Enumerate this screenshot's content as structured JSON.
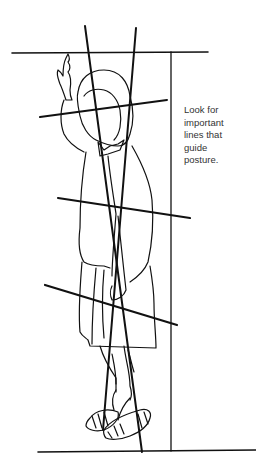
{
  "caption": {
    "text": "Look for\nimportant\nlines that\nguide\nposture."
  },
  "figure": {
    "guide_lines": [
      {
        "name": "top-horizontal",
        "x1": 12,
        "y1": 53,
        "x2": 208,
        "y2": 52
      },
      {
        "name": "bottom-horizontal",
        "x1": 38,
        "y1": 452,
        "x2": 256,
        "y2": 450
      },
      {
        "name": "right-vertical",
        "x1": 171,
        "y1": 52,
        "x2": 171,
        "y2": 451
      },
      {
        "name": "axis-line-1",
        "x1": 85,
        "y1": 26,
        "x2": 142,
        "y2": 452
      },
      {
        "name": "axis-line-2",
        "x1": 136,
        "y1": 28,
        "x2": 103,
        "y2": 430
      },
      {
        "name": "eye-line",
        "x1": 40,
        "y1": 117,
        "x2": 167,
        "y2": 100
      },
      {
        "name": "waist-line",
        "x1": 58,
        "y1": 198,
        "x2": 190,
        "y2": 218
      },
      {
        "name": "hip-line",
        "x1": 45,
        "y1": 285,
        "x2": 177,
        "y2": 325
      }
    ],
    "line_color": "#111111"
  }
}
